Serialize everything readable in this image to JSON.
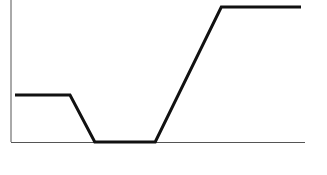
{
  "chart_data": {
    "type": "line",
    "title": "",
    "xlabel": "",
    "ylabel": "",
    "grid": false,
    "legend": null,
    "x": [
      0,
      1.0,
      1.45,
      2.55,
      3.75,
      5.2
    ],
    "series": [
      {
        "name": "",
        "values": [
          1,
          1,
          0,
          0,
          2.87,
          2.87
        ]
      }
    ],
    "xlim": [
      0,
      5.3
    ],
    "ylim": [
      0,
      2.9
    ],
    "colors": {
      "line": "#111111",
      "axis": "#555555"
    }
  }
}
